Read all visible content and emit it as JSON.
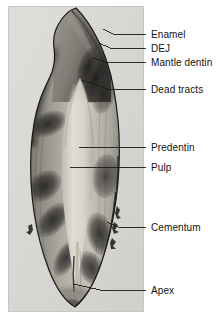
{
  "figure": {
    "kind": "micrograph",
    "panel": {
      "x": 8,
      "y": 6,
      "width": 136,
      "height": 306
    },
    "background_color": "#ffffff",
    "slide_color": "#d8d8d6",
    "label_color": "#121212",
    "leader_color": "#1a1a1a"
  },
  "labels": [
    {
      "id": "enamel",
      "text": "Enamel",
      "text_x": 151,
      "text_y": 29,
      "leader": {
        "x1": 146,
        "y1": 34,
        "x2": 113,
        "y2": 34,
        "x3": 103,
        "y3": 29
      }
    },
    {
      "id": "dej",
      "text": "DEJ",
      "text_x": 151,
      "text_y": 43,
      "leader": {
        "x1": 146,
        "y1": 48,
        "x2": 110,
        "y2": 48,
        "x3": 99,
        "y3": 43
      }
    },
    {
      "id": "mantle-dentin",
      "text": "Mantle dentin",
      "text_x": 151,
      "text_y": 57,
      "leader": {
        "x1": 146,
        "y1": 62,
        "x2": 105,
        "y2": 62,
        "x3": 93,
        "y3": 58
      }
    },
    {
      "id": "dead-tracts",
      "text": "Dead tracts",
      "text_x": 151,
      "text_y": 84,
      "leader": {
        "x1": 146,
        "y1": 89,
        "x2": 108,
        "y2": 89,
        "x3": 82,
        "y3": 80
      }
    },
    {
      "id": "predentin",
      "text": "Predentin",
      "text_x": 151,
      "text_y": 142,
      "leader": {
        "x1": 146,
        "y1": 147,
        "x2": 110,
        "y2": 147,
        "x3": 79,
        "y3": 147
      }
    },
    {
      "id": "pulp",
      "text": "Pulp",
      "text_x": 151,
      "text_y": 162,
      "leader": {
        "x1": 146,
        "y1": 167,
        "x2": 108,
        "y2": 167,
        "x3": 70,
        "y3": 167
      }
    },
    {
      "id": "cementum",
      "text": "Cementum",
      "text_x": 151,
      "text_y": 222,
      "leader": {
        "x1": 146,
        "y1": 227,
        "x2": 118,
        "y2": 227,
        "x3": 107,
        "y3": 222
      }
    },
    {
      "id": "apex",
      "text": "Apex",
      "text_x": 151,
      "text_y": 285,
      "leader": {
        "x1": 146,
        "y1": 290,
        "x2": 100,
        "y2": 290,
        "x3": 73,
        "y3": 284
      }
    }
  ],
  "specimen": {
    "name": "tooth-ground-section",
    "regions": [
      {
        "id": "enamel-cap",
        "label": "Enamel",
        "tone": "#4a4846"
      },
      {
        "id": "dentino-enamel-junction",
        "label": "DEJ",
        "tone": "#2c2a28"
      },
      {
        "id": "mantle-dentin-band",
        "label": "Mantle dentin",
        "tone": "#6d6a66"
      },
      {
        "id": "dead-tract-bands",
        "label": "Dead tracts",
        "tone": "#232120"
      },
      {
        "id": "predentin-zone",
        "label": "Predentin",
        "tone": "#c9c6bd"
      },
      {
        "id": "pulp-chamber",
        "label": "Pulp",
        "tone": "#dedbd2"
      },
      {
        "id": "cementum-layer",
        "label": "Cementum",
        "tone": "#3a3836"
      },
      {
        "id": "root-apex",
        "label": "Apex",
        "tone": "#8d8a84"
      }
    ]
  }
}
